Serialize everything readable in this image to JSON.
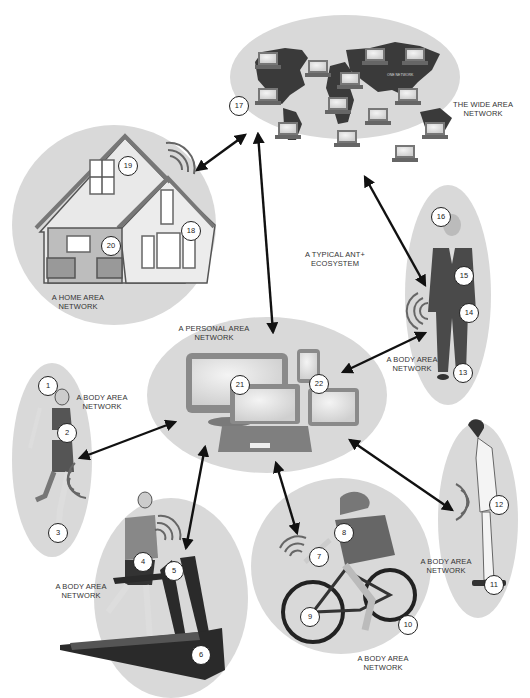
{
  "diagram": {
    "title": "A TYPICAL ANT+\nECOSYSTEM",
    "colors": {
      "ellipse_fill": "#d9d9d9",
      "dark_fill": "#3a3a3a",
      "device_fill": "#8a8a8a",
      "screen_fill": "#e8e8e8",
      "arrow": "#111111",
      "badge_border": "#222222",
      "label_text": "#333333"
    },
    "networks": [
      {
        "id": "wan",
        "label": "THE WIDE AREA\nNETWORK",
        "inner_label": "ONE NETWORK",
        "badges": [
          "17"
        ]
      },
      {
        "id": "han",
        "label": "A HOME AREA\nNETWORK",
        "badges": [
          "18",
          "19",
          "20"
        ]
      },
      {
        "id": "pan",
        "label": "A PERSONAL AREA\nNETWORK",
        "badges": [
          "21",
          "22"
        ]
      },
      {
        "id": "ban-businessman",
        "label": "A BODY AREA\nNETWORK",
        "badges": [
          "13",
          "14",
          "15",
          "16"
        ]
      },
      {
        "id": "ban-runner",
        "label": "A BODY AREA\nNETWORK",
        "badges": [
          "1",
          "2",
          "3"
        ]
      },
      {
        "id": "ban-treadmill",
        "label": "A BODY AREA\nNETWORK",
        "badges": [
          "4",
          "5",
          "6"
        ]
      },
      {
        "id": "ban-cyclist",
        "label": "A BODY AREA\nNETWORK",
        "badges": [
          "7",
          "8",
          "9",
          "10"
        ]
      },
      {
        "id": "ban-scale",
        "label": "A BODY AREA\nNETWORK",
        "badges": [
          "11",
          "12"
        ]
      }
    ],
    "badges": {
      "b1": "1",
      "b2": "2",
      "b3": "3",
      "b4": "4",
      "b5": "5",
      "b6": "6",
      "b7": "7",
      "b8": "8",
      "b9": "9",
      "b10": "10",
      "b11": "11",
      "b12": "12",
      "b13": "13",
      "b14": "14",
      "b15": "15",
      "b16": "16",
      "b17": "17",
      "b18": "18",
      "b19": "19",
      "b20": "20",
      "b21": "21",
      "b22": "22"
    },
    "connections": [
      {
        "from": "han",
        "to": "wan",
        "type": "bidirectional"
      },
      {
        "from": "pan",
        "to": "wan",
        "type": "bidirectional"
      },
      {
        "from": "ban-businessman",
        "to": "wan",
        "type": "bidirectional"
      },
      {
        "from": "ban-businessman",
        "to": "pan",
        "type": "bidirectional"
      },
      {
        "from": "ban-runner",
        "to": "pan",
        "type": "bidirectional"
      },
      {
        "from": "ban-treadmill",
        "to": "pan",
        "type": "bidirectional"
      },
      {
        "from": "ban-cyclist",
        "to": "pan",
        "type": "bidirectional"
      },
      {
        "from": "ban-scale",
        "to": "pan",
        "type": "bidirectional"
      }
    ]
  }
}
